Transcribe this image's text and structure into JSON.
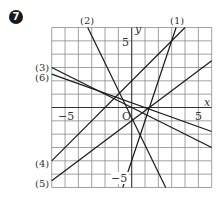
{
  "problem_number": "7",
  "diagram": {
    "type": "coordinate-plane-with-lines",
    "x_axis_label": "x",
    "y_axis_label": "y",
    "origin_label": "O",
    "x_range": [
      -6,
      6
    ],
    "y_range": [
      -6,
      6
    ],
    "grid_step": 1,
    "tick_labels": {
      "x_neg": "−5",
      "x_pos": "5",
      "y_pos": "5",
      "y_neg": "−5"
    },
    "lines": [
      {
        "id": "1",
        "label": "(1)",
        "equation": "y = 3x − 4",
        "from": [
          -0.67,
          -6
        ],
        "to": [
          3.33,
          6
        ]
      },
      {
        "id": "2",
        "label": "(2)",
        "equation": "y ≈ −2x − 0.6",
        "from": [
          -3.3,
          6
        ],
        "to": [
          2.55,
          -6
        ]
      },
      {
        "id": "3",
        "label": "(3)",
        "equation": "y = −x/2",
        "from": [
          -6,
          3
        ],
        "to": [
          6,
          -3
        ]
      },
      {
        "id": "4",
        "label": "(4)",
        "equation": "y = x + 2",
        "from": [
          -6,
          -4
        ],
        "to": [
          4,
          6
        ]
      },
      {
        "id": "5",
        "label": "(5)",
        "equation": "y = 3x/4 − 1",
        "from": [
          -6,
          -5.5
        ],
        "to": [
          6,
          3.5
        ]
      },
      {
        "id": "6",
        "label": "(6)",
        "equation": "y ≈ −0.36x + 0.35",
        "from": [
          -6,
          2.5
        ],
        "to": [
          6,
          -1.8
        ]
      }
    ],
    "colors": {
      "grid": "#8a8a8a",
      "axis": "#333333",
      "line": "#1a1a1a",
      "label": "#555555"
    }
  }
}
